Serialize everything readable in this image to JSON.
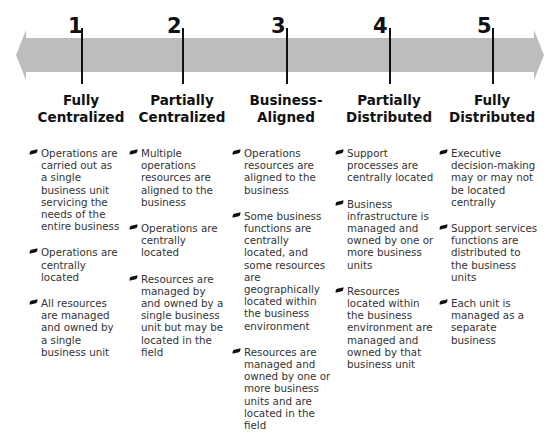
{
  "arrow": {
    "fill_color": "#bdbdbd",
    "direction": "bidirectional"
  },
  "stages": [
    {
      "number": "1",
      "title_line1": "Fully",
      "title_line2": "Centralized",
      "items": [
        "Operations are carried out as a single business unit servicing the needs of the entire business",
        "Operations are centrally located",
        "All resources are managed and owned by a single business unit"
      ]
    },
    {
      "number": "2",
      "title_line1": "Partially",
      "title_line2": "Centralized",
      "items": [
        "Multiple operations resources are aligned to the business",
        "Operations are centrally located",
        "Resources are managed by and owned by a single business unit but may be located in the field"
      ]
    },
    {
      "number": "3",
      "title_line1": "Business-",
      "title_line2": "Aligned",
      "items": [
        "Operations resources are aligned to the business",
        "Some business functions are centrally located, and some resources are geographically located within the business environment",
        "Resources are managed and owned by one or more business units and are located in the field"
      ]
    },
    {
      "number": "4",
      "title_line1": "Partially",
      "title_line2": "Distributed",
      "items": [
        "Support processes are centrally located",
        "Business infrastructure is managed and owned by one or more business units",
        "Resources located within the business environment are managed and owned by that business unit"
      ]
    },
    {
      "number": "5",
      "title_line1": "Fully",
      "title_line2": "Distributed",
      "items": [
        "Executive decision-making may or may not be located centrally",
        "Support services functions are distributed to the business units",
        "Each unit is managed as a separate business"
      ]
    }
  ]
}
